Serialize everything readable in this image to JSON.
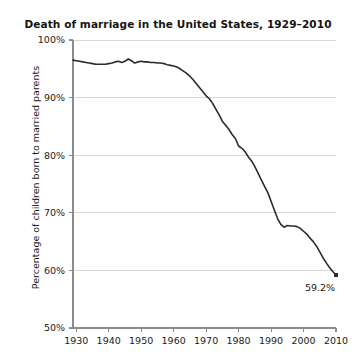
{
  "chart_data": {
    "type": "line",
    "title": "Death of marriage in the United States, 1929–2010",
    "xlabel": "",
    "ylabel": "Percentage of children born to married parents",
    "xlim": [
      1929,
      2010
    ],
    "ylim": [
      50,
      100
    ],
    "grid": true,
    "legend": "none",
    "ytick_labels": [
      "100%",
      "90%",
      "80%",
      "70%",
      "60%",
      "50%"
    ],
    "ytick_values": [
      100,
      90,
      80,
      70,
      60,
      50
    ],
    "xtick_labels": [
      "1930",
      "1940",
      "1950",
      "1960",
      "1970",
      "1980",
      "1990",
      "2000",
      "2010"
    ],
    "xtick_values": [
      1930,
      1940,
      1950,
      1960,
      1970,
      1980,
      1990,
      2000,
      2010
    ],
    "annotations": [
      {
        "text": "59.2%",
        "x": 2010,
        "y": 59.2
      }
    ],
    "series": [
      {
        "name": "Percentage of children born to married parents",
        "color": "#2b2b2b",
        "x": [
          1929,
          1930,
          1931,
          1932,
          1933,
          1934,
          1935,
          1936,
          1937,
          1938,
          1939,
          1940,
          1941,
          1942,
          1943,
          1944,
          1945,
          1946,
          1947,
          1948,
          1949,
          1950,
          1951,
          1952,
          1953,
          1954,
          1955,
          1956,
          1957,
          1958,
          1959,
          1960,
          1961,
          1962,
          1963,
          1964,
          1965,
          1966,
          1967,
          1968,
          1969,
          1970,
          1971,
          1972,
          1973,
          1974,
          1975,
          1976,
          1977,
          1978,
          1979,
          1980,
          1981,
          1982,
          1983,
          1984,
          1985,
          1986,
          1987,
          1988,
          1989,
          1990,
          1991,
          1992,
          1993,
          1994,
          1995,
          1996,
          1997,
          1998,
          1999,
          2000,
          2001,
          2002,
          2003,
          2004,
          2005,
          2006,
          2007,
          2008,
          2009,
          2010
        ],
        "values": [
          96.5,
          96.4,
          96.3,
          96.2,
          96.1,
          96.0,
          95.9,
          95.8,
          95.8,
          95.8,
          95.8,
          95.9,
          96.0,
          96.2,
          96.3,
          96.1,
          96.3,
          96.7,
          96.4,
          96.0,
          96.2,
          96.3,
          96.2,
          96.2,
          96.1,
          96.1,
          96.0,
          96.0,
          95.9,
          95.7,
          95.6,
          95.5,
          95.3,
          95.0,
          94.6,
          94.2,
          93.7,
          93.1,
          92.4,
          91.7,
          91.0,
          90.3,
          89.8,
          89.0,
          88.0,
          87.0,
          85.9,
          85.2,
          84.5,
          83.6,
          82.9,
          81.6,
          81.2,
          80.6,
          79.7,
          79.0,
          78.0,
          76.9,
          75.7,
          74.6,
          73.5,
          72.0,
          70.5,
          69.0,
          68.0,
          67.5,
          67.8,
          67.7,
          67.7,
          67.6,
          67.3,
          66.8,
          66.3,
          65.6,
          65.0,
          64.2,
          63.2,
          62.2,
          61.3,
          60.5,
          59.8,
          59.2
        ]
      }
    ]
  }
}
